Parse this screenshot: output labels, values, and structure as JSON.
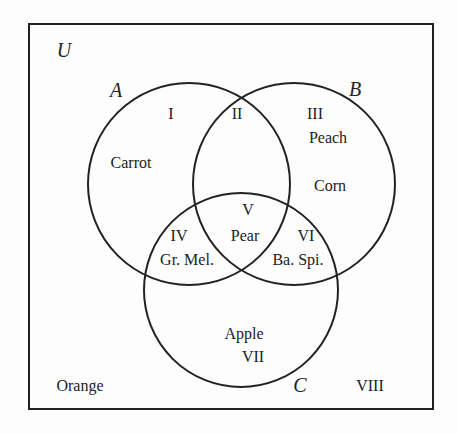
{
  "diagram": {
    "type": "venn-3-set",
    "universe_label": "U",
    "sets": [
      {
        "name": "A",
        "label": "A"
      },
      {
        "name": "B",
        "label": "B"
      },
      {
        "name": "C",
        "label": "C"
      }
    ],
    "regions": [
      {
        "numeral": "I",
        "item": "Carrot"
      },
      {
        "numeral": "II",
        "item": ""
      },
      {
        "numeral": "III",
        "item": "Peach"
      },
      {
        "numeral": "IV",
        "item": "Gr. Mel."
      },
      {
        "numeral": "V",
        "item": "Pear"
      },
      {
        "numeral": "VI",
        "item": "Ba. Spi."
      },
      {
        "numeral": "VII",
        "item": "Apple"
      },
      {
        "numeral": "VIII",
        "item": "Orange"
      }
    ],
    "extra_items": {
      "region_III_second": "Corn"
    },
    "colors": {
      "stroke": "#222222",
      "background": "#fdfdfd"
    }
  }
}
